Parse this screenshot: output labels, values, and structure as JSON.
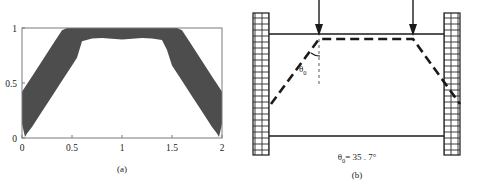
{
  "figure": {
    "panels": [
      {
        "id": "a",
        "caption": "(a)",
        "kind": "plot"
      },
      {
        "id": "b",
        "caption": "(b)",
        "kind": "diagram",
        "angle_symbol": "θ",
        "angle_subscript": "0",
        "angle_equation": "= 35 . 7°",
        "angle_label_symbol": "θ",
        "angle_label_subscript": "0",
        "loads": [
          {
            "name": "load-arrow-left",
            "x": 318
          },
          {
            "name": "load-arrow-right",
            "x": 412
          }
        ],
        "walls": [
          {
            "name": "wall-left"
          },
          {
            "name": "wall-right"
          }
        ]
      }
    ]
  },
  "chart_data": {
    "type": "area",
    "title": "",
    "xlabel": "",
    "ylabel": "",
    "xlim": [
      0,
      2
    ],
    "ylim": [
      0,
      1
    ],
    "xticks": [
      0,
      0.5,
      1,
      1.5,
      2
    ],
    "xticklabels": [
      "0",
      "0.5",
      "1",
      "1.5",
      "2"
    ],
    "yticks": [
      0,
      0.5,
      1
    ],
    "yticklabels": [
      "0",
      "0.5",
      "1"
    ],
    "grid": false,
    "legend": null,
    "fill_color": "#4d4d4d",
    "series": [
      {
        "name": "upper",
        "x": [
          0.0,
          0.05,
          0.1,
          0.2,
          0.3,
          0.4,
          0.45,
          0.5,
          0.6,
          0.8,
          1.0,
          1.2,
          1.4,
          1.5,
          1.55,
          1.6,
          1.7,
          1.8,
          1.9,
          1.95,
          2.0
        ],
        "values": [
          0.42,
          0.49,
          0.56,
          0.7,
          0.84,
          0.98,
          1.0,
          1.0,
          1.0,
          1.0,
          1.0,
          1.0,
          1.0,
          1.0,
          1.0,
          0.98,
          0.84,
          0.7,
          0.56,
          0.49,
          0.42
        ]
      },
      {
        "name": "lower",
        "x": [
          0.0,
          0.03,
          0.05,
          0.1,
          0.2,
          0.3,
          0.4,
          0.5,
          0.55,
          0.6,
          0.7,
          0.8,
          1.0,
          1.2,
          1.3,
          1.4,
          1.45,
          1.5,
          1.6,
          1.7,
          1.8,
          1.9,
          1.95,
          1.97,
          2.0
        ],
        "values": [
          0.13,
          0.01,
          0.04,
          0.1,
          0.24,
          0.38,
          0.52,
          0.66,
          0.73,
          0.88,
          0.905,
          0.91,
          0.895,
          0.91,
          0.905,
          0.89,
          0.8,
          0.66,
          0.52,
          0.38,
          0.24,
          0.1,
          0.04,
          0.01,
          0.13
        ]
      }
    ]
  }
}
